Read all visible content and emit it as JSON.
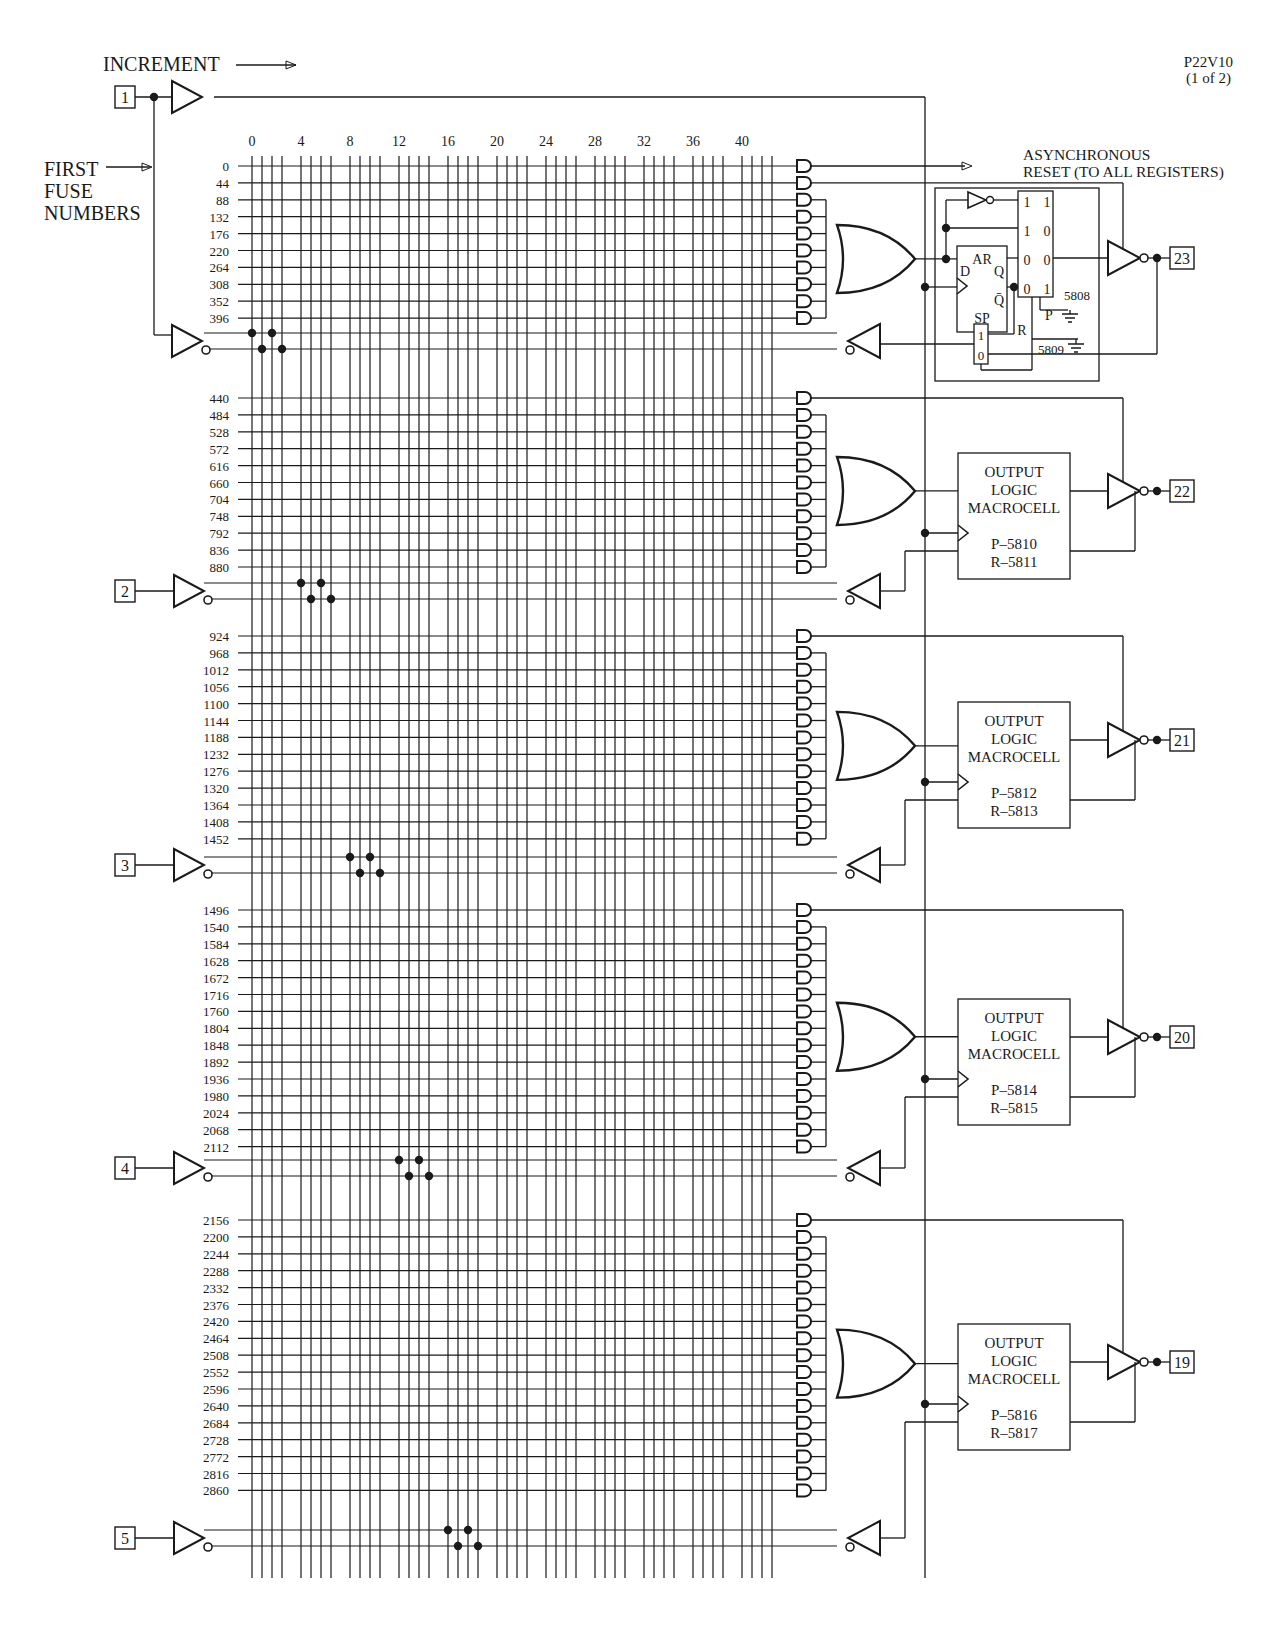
{
  "header": {
    "part_number": "P22V10",
    "page_indicator": "(1 of 2)",
    "increment_label": "INCREMENT",
    "first_fuse_label": [
      "FIRST",
      "FUSE",
      "NUMBERS"
    ],
    "async_reset_label": [
      "ASYNCHRONOUS",
      "RESET (TO ALL REGISTERS)"
    ]
  },
  "column_numbers": [
    "0",
    "4",
    "8",
    "12",
    "16",
    "20",
    "24",
    "28",
    "32",
    "36",
    "40"
  ],
  "input_pins": [
    {
      "pin": "1",
      "role": "clock-and-input"
    },
    {
      "pin": "2"
    },
    {
      "pin": "3"
    },
    {
      "pin": "4"
    },
    {
      "pin": "5"
    }
  ],
  "sections": [
    {
      "output_pin": "23",
      "type": "detailed-register",
      "fuse_rows": [
        "0",
        "44",
        "88",
        "132",
        "176",
        "220",
        "264",
        "308",
        "352",
        "396"
      ],
      "special_rows": {
        "async_reset": "0",
        "output_enable": "44"
      },
      "register": {
        "ar_label": "AR",
        "d_label": "D",
        "q_label": "Q",
        "qbar_label": "Q̄",
        "sp_label": "SP",
        "mux4_inputs": [
          [
            "1",
            "1"
          ],
          [
            "1",
            "0"
          ],
          [
            "0",
            "0"
          ],
          [
            "0",
            "1"
          ]
        ],
        "p_fuse": "5808",
        "p_label": "P",
        "r_fuse": "5809",
        "r_label": "R",
        "mux2_inputs": [
          "1",
          "0"
        ]
      }
    },
    {
      "output_pin": "22",
      "type": "macrocell",
      "fuse_rows": [
        "440",
        "484",
        "528",
        "572",
        "616",
        "660",
        "704",
        "748",
        "792",
        "836",
        "880"
      ],
      "macrocell": {
        "title": [
          "OUTPUT",
          "LOGIC",
          "MACROCELL"
        ],
        "p": "P–5810",
        "r": "R–5811"
      }
    },
    {
      "output_pin": "21",
      "type": "macrocell",
      "fuse_rows": [
        "924",
        "968",
        "1012",
        "1056",
        "1100",
        "1144",
        "1188",
        "1232",
        "1276",
        "1320",
        "1364",
        "1408",
        "1452"
      ],
      "macrocell": {
        "title": [
          "OUTPUT",
          "LOGIC",
          "MACROCELL"
        ],
        "p": "P–5812",
        "r": "R–5813"
      }
    },
    {
      "output_pin": "20",
      "type": "macrocell",
      "fuse_rows": [
        "1496",
        "1540",
        "1584",
        "1628",
        "1672",
        "1716",
        "1760",
        "1804",
        "1848",
        "1892",
        "1936",
        "1980",
        "2024",
        "2068",
        "2112"
      ],
      "macrocell": {
        "title": [
          "OUTPUT",
          "LOGIC",
          "MACROCELL"
        ],
        "p": "P–5814",
        "r": "R–5815"
      }
    },
    {
      "output_pin": "19",
      "type": "macrocell",
      "fuse_rows": [
        "2156",
        "2200",
        "2244",
        "2288",
        "2332",
        "2376",
        "2420",
        "2464",
        "2508",
        "2552",
        "2596",
        "2640",
        "2684",
        "2728",
        "2772",
        "2816",
        "2860"
      ],
      "macrocell": {
        "title": [
          "OUTPUT",
          "LOGIC",
          "MACROCELL"
        ],
        "p": "P–5816",
        "r": "R–5817"
      }
    }
  ],
  "colors": {
    "ink": "#1a1a1a",
    "background": "#ffffff"
  }
}
